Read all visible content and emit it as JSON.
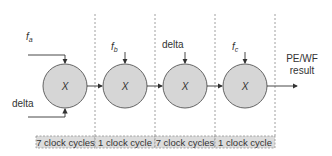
{
  "diagram": {
    "inputs": {
      "fa": {
        "base": "f",
        "sub": "a"
      },
      "delta1": "delta",
      "fb": {
        "base": "f",
        "sub": "b"
      },
      "delta2": "delta",
      "fc": {
        "base": "f",
        "sub": "c"
      }
    },
    "nodes": [
      {
        "label": "X"
      },
      {
        "label": "X"
      },
      {
        "label": "X"
      },
      {
        "label": "X"
      }
    ],
    "output": {
      "line1": "PE/WF",
      "line2": "result"
    },
    "stages": [
      {
        "label": "7 clock cycles"
      },
      {
        "label": "1 clock cycle"
      },
      {
        "label": "7 clock cycles"
      },
      {
        "label": "1 clock cycle"
      }
    ],
    "colors": {
      "node_fill": "#d6d6d6",
      "node_stroke": "#555555",
      "stage_fill": "#dcdcdc",
      "line": "#333333"
    }
  }
}
